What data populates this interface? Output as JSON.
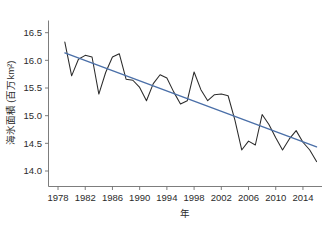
{
  "chart_data": {
    "type": "line",
    "title": "",
    "xlabel": "年",
    "ylabel": "海氷面積 (百万km²)",
    "xlim": [
      1976.6,
      2016.8
    ],
    "ylim": [
      13.72,
      16.72
    ],
    "grid": false,
    "legend": null,
    "xticks": [
      1978,
      1982,
      1986,
      1990,
      1994,
      1998,
      2002,
      2006,
      2010,
      2014
    ],
    "xtick_labels": [
      "1978",
      "1982",
      "1986",
      "1990",
      "1994",
      "1998",
      "2002",
      "2006",
      "2010",
      "2014"
    ],
    "yticks": [
      14.0,
      14.5,
      15.0,
      15.5,
      16.0,
      16.5
    ],
    "ytick_labels": [
      "14.0",
      "14.5",
      "15.0",
      "15.5",
      "16.0",
      "16.5"
    ],
    "x": [
      1979,
      1980,
      1981,
      1982,
      1983,
      1984,
      1985,
      1986,
      1987,
      1988,
      1989,
      1990,
      1991,
      1992,
      1993,
      1994,
      1995,
      1996,
      1997,
      1998,
      1999,
      2000,
      2001,
      2002,
      2003,
      2004,
      2005,
      2006,
      2007,
      2008,
      2009,
      2010,
      2011,
      2012,
      2013,
      2014,
      2015,
      2016
    ],
    "series": [
      {
        "name": "海氷面積",
        "color": "#2b2b2b",
        "values": [
          16.33,
          15.72,
          16.02,
          16.09,
          16.06,
          15.39,
          15.78,
          16.06,
          16.12,
          15.66,
          15.64,
          15.51,
          15.27,
          15.58,
          15.74,
          15.68,
          15.43,
          15.21,
          15.27,
          15.79,
          15.47,
          15.27,
          15.38,
          15.39,
          15.36,
          14.92,
          14.38,
          14.54,
          14.47,
          15.02,
          14.84,
          14.6,
          14.38,
          14.58,
          14.73,
          14.52,
          14.38,
          14.17
        ]
      }
    ],
    "trend": {
      "name": "線形トレンド",
      "color": "#4a6fa8",
      "x": [
        1979,
        2016
      ],
      "y": [
        16.135,
        14.435
      ]
    }
  }
}
